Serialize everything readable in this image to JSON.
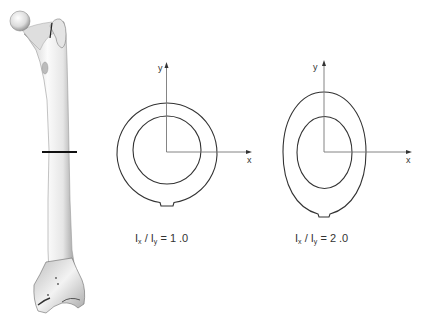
{
  "figure": {
    "femur": {
      "label": "femur-illustration",
      "section_line_y": 152
    },
    "sections": [
      {
        "id": "circular",
        "shape": "circle",
        "axis_x_label": "x",
        "axis_y_label": "y",
        "caption": {
          "I": "I",
          "sub_x": "x",
          "slash": "/",
          "sub_y": "y",
          "equals": "=",
          "value": "1 .0"
        }
      },
      {
        "id": "elliptical",
        "shape": "ellipse",
        "axis_x_label": "x",
        "axis_y_label": "y",
        "caption": {
          "I": "I",
          "sub_x": "x",
          "slash": "/",
          "sub_y": "y",
          "equals": "=",
          "value": "2 .0"
        }
      }
    ],
    "colors": {
      "outline": "#333333",
      "axis": "#777777",
      "bone_light": "#f2f2f2",
      "bone_shade": "#9a9a9a",
      "section_line": "#111111"
    }
  }
}
